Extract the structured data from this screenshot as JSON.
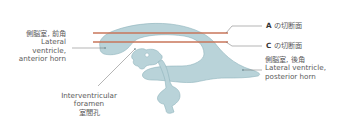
{
  "figure": {
    "colors": {
      "ventricle_fill": "#b9d3d9",
      "ventricle_stroke": "#8eb3bc",
      "section_line": "#c8765a",
      "leader_line": "#6a6a6a",
      "text": "#5a5a5a"
    },
    "labels": {
      "anterior_horn": {
        "jp": "側脳室, 前角",
        "en_line1": "Lateral",
        "en_line2": "ventricle,",
        "en_line3": "anterior horn"
      },
      "section_a": {
        "letter": "A",
        "text": "の切断面"
      },
      "section_c": {
        "letter": "C",
        "text": "の切断面"
      },
      "posterior_horn": {
        "jp": "側脳室, 後角",
        "en_line1": "Lateral ventricle,",
        "en_line2": "posterior horn"
      },
      "foramen": {
        "en_line1": "Interventricular",
        "en_line2": "foramen",
        "jp": "室間孔"
      }
    }
  }
}
